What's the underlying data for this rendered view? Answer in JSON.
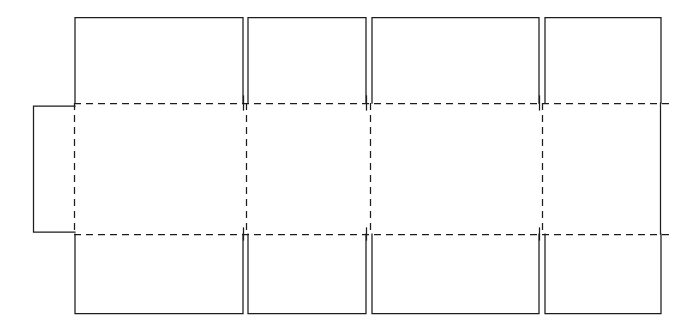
{
  "figure": {
    "drawing_type": "line-drawing",
    "canvas": {
      "width": 695,
      "height": 334
    },
    "colors": {
      "background": "#ffffff",
      "cut_line": "#1d1d1d",
      "fold_line": "#1d1d1d"
    },
    "line_styles": {
      "cut": "solid",
      "fold": "dashed"
    }
  },
  "geometry": {
    "fold_y_top": 103,
    "fold_y_bottom": 234,
    "flap_top_y": 17,
    "flap_bottom_y": 314,
    "panel_x": [
      74,
      246,
      370,
      542,
      661
    ],
    "glue_tab": {
      "x1": 33,
      "y1": 106,
      "x2": 75,
      "y2": 232
    },
    "flap_gap": 5
  },
  "parts": {
    "top_flaps": [
      {
        "name": "top-flap-1",
        "x1": 75,
        "x2": 243,
        "y1": 17,
        "y2": 103
      },
      {
        "name": "top-flap-2",
        "x1": 248,
        "x2": 366,
        "y1": 17,
        "y2": 103
      },
      {
        "name": "top-flap-3",
        "x1": 372,
        "x2": 539,
        "y1": 17,
        "y2": 103
      },
      {
        "name": "top-flap-4",
        "x1": 545,
        "x2": 661,
        "y1": 17,
        "y2": 103
      }
    ],
    "middle_panels": [
      {
        "name": "panel-1",
        "x1": 74,
        "x2": 246
      },
      {
        "name": "panel-2",
        "x1": 246,
        "x2": 370
      },
      {
        "name": "panel-3",
        "x1": 370,
        "x2": 542
      },
      {
        "name": "panel-4",
        "x1": 542,
        "x2": 661
      }
    ],
    "bottom_flaps": [
      {
        "name": "bottom-flap-1",
        "x1": 75,
        "x2": 243,
        "y1": 234,
        "y2": 314
      },
      {
        "name": "bottom-flap-2",
        "x1": 248,
        "x2": 366,
        "y1": 234,
        "y2": 314
      },
      {
        "name": "bottom-flap-3",
        "x1": 372,
        "x2": 539,
        "y1": 234,
        "y2": 314
      },
      {
        "name": "bottom-flap-4",
        "x1": 545,
        "x2": 661,
        "y1": 234,
        "y2": 314
      }
    ],
    "glue_tab": {
      "name": "glue-tab"
    }
  },
  "labels": {
    "none_visible": ""
  }
}
